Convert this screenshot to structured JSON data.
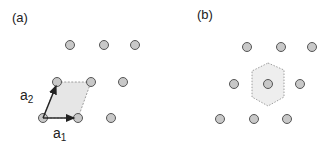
{
  "panels": {
    "a": {
      "label": "(a)",
      "vector_a1": "a",
      "vector_a1_sub": "1",
      "vector_a2": "a",
      "vector_a2_sub": "2",
      "lattice_points": [
        [
          70,
          45
        ],
        [
          104,
          45
        ],
        [
          135,
          45
        ],
        [
          57,
          82
        ],
        [
          91,
          82
        ],
        [
          123,
          82
        ],
        [
          43,
          118
        ],
        [
          78,
          118
        ],
        [
          111,
          118
        ]
      ],
      "unit_cell": "parallelogram"
    },
    "b": {
      "label": "(b)",
      "lattice_points": [
        [
          247,
          47
        ],
        [
          281,
          47
        ],
        [
          312,
          47
        ],
        [
          234,
          84
        ],
        [
          268,
          84
        ],
        [
          300,
          84
        ],
        [
          220,
          119
        ],
        [
          254,
          119
        ],
        [
          287,
          119
        ]
      ],
      "unit_cell": "hexagon (Wigner-Seitz cell)"
    }
  },
  "colors": {
    "atom_fill": "#c8c8c8",
    "atom_stroke": "#555555",
    "cell_fill": "#e6e6e6",
    "cell_stroke": "#888888",
    "arrow": "#222222"
  }
}
